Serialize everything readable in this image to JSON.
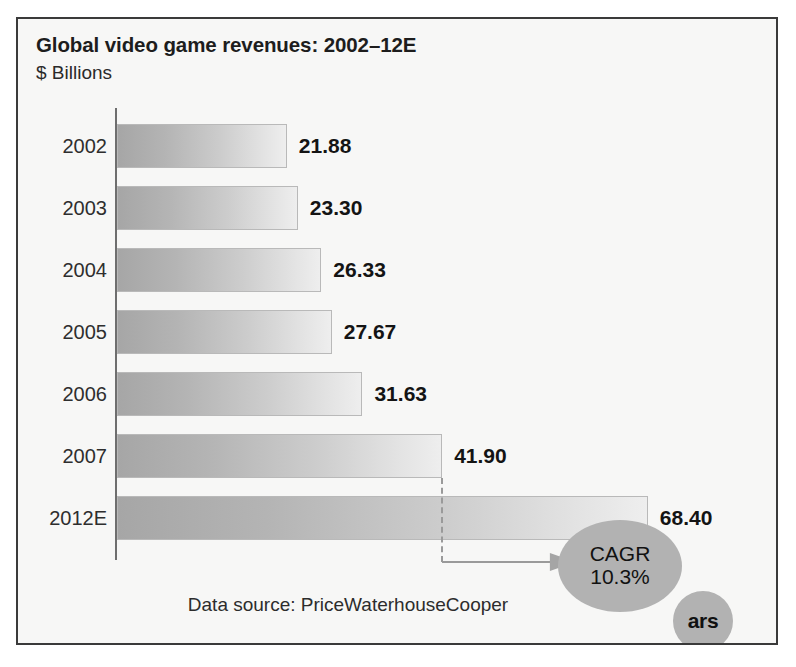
{
  "figure": {
    "title": "Global video game revenues: 2002–12E",
    "subtitle": "$ Billions",
    "data_source": "Data source: PriceWaterhouseCooper",
    "logo_text": "ars",
    "frame_color": "#3a3a3a",
    "background_color": "#f7f7f6"
  },
  "annotation": {
    "cagr_label": "CAGR",
    "cagr_value": "10.3%",
    "bubble_color": "#b2b2b2",
    "from_category": "2007",
    "to_category": "2012E"
  },
  "chart_data": {
    "type": "bar",
    "orientation": "horizontal",
    "title": "Global video game revenues: 2002–12E",
    "subtitle": "$ Billions",
    "xlabel": "",
    "ylabel": "$ Billions",
    "grid": false,
    "legend": false,
    "xlim": [
      0,
      72
    ],
    "categories": [
      "2002",
      "2003",
      "2004",
      "2005",
      "2006",
      "2007",
      "2012E"
    ],
    "values": [
      21.88,
      23.3,
      26.33,
      27.67,
      31.63,
      41.9,
      68.4
    ],
    "value_labels": [
      "21.88",
      "23.30",
      "26.33",
      "27.67",
      "31.63",
      "41.90",
      "68.40"
    ],
    "bar_gradient": [
      "#a6a6a6",
      "#eeeeee"
    ],
    "bar_border_color": "#b9b9b9",
    "annotations": [
      {
        "text": "CAGR 10.3%",
        "from": "2007",
        "to": "2012E"
      }
    ],
    "source": "Data source: PriceWaterhouseCooper"
  }
}
